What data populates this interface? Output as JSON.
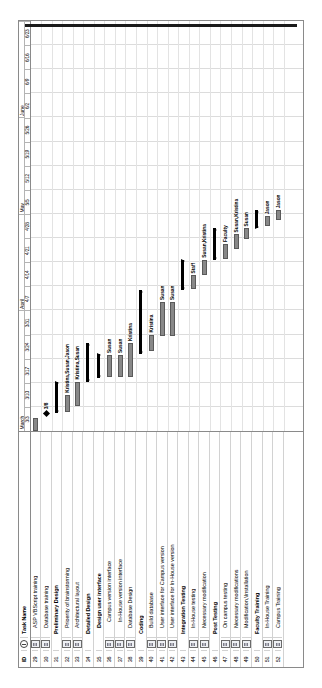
{
  "app": {
    "view": "Gantt Chart",
    "orientation": "rotated-90"
  },
  "columns": {
    "id": "ID",
    "indicator": "i",
    "task_name": "Task Name"
  },
  "timescale": {
    "months": [
      {
        "label": "March",
        "weeks": 5
      },
      {
        "label": "April",
        "weeks": 4
      },
      {
        "label": "May",
        "weeks": 4
      },
      {
        "label": "June",
        "weeks": 4
      }
    ],
    "weeks": [
      "3/3",
      "3/10",
      "3/17",
      "3/24",
      "3/31",
      "4/7",
      "4/14",
      "4/21",
      "4/28",
      "5/5",
      "5/12",
      "5/19",
      "5/26",
      "6/2",
      "6/9",
      "6/16",
      "6/23"
    ]
  },
  "colors": {
    "task_bar": "#888888",
    "task_bar_border": "#5a5a5a",
    "summary_bar": "#000000",
    "milestone": "#000000",
    "gridline": "#dcdcdc",
    "table_border": "#8a8a8a"
  },
  "chart_data": {
    "type": "bar",
    "xlabel": "",
    "ylabel": "",
    "x": [
      "3/3",
      "3/10",
      "3/17",
      "3/24",
      "3/31",
      "4/7",
      "4/14",
      "4/21",
      "4/28",
      "5/5",
      "5/12",
      "5/19",
      "5/26",
      "6/2",
      "6/9",
      "6/16",
      "6/23"
    ],
    "rows": [
      {
        "id": 29,
        "name": "ASP VBScript training",
        "indent": 1,
        "bold": false,
        "note": true,
        "kind": "task",
        "start_wk": 0.0,
        "end_wk": 0.55,
        "label": "",
        "label_side": "right"
      },
      {
        "id": 30,
        "name": "Database training",
        "indent": 1,
        "bold": false,
        "note": true,
        "kind": "milestone",
        "start_wk": 0.72,
        "end_wk": 0.72,
        "label": "3/8",
        "label_side": "right"
      },
      {
        "id": 31,
        "name": "Preliminary Design",
        "indent": 0,
        "bold": true,
        "note": false,
        "kind": "summary",
        "start_wk": 0.75,
        "end_wk": 2.05,
        "label": "",
        "label_side": "right"
      },
      {
        "id": 32,
        "name": "Prioerity of brainstorming",
        "indent": 1,
        "bold": false,
        "note": true,
        "kind": "task",
        "start_wk": 0.8,
        "end_wk": 1.5,
        "label": "Kristina,Susan,Jason",
        "label_side": "right"
      },
      {
        "id": 33,
        "name": "Architectural layout",
        "indent": 1,
        "bold": false,
        "note": true,
        "kind": "task",
        "start_wk": 1.05,
        "end_wk": 2.05,
        "label": "Kristina,Susan",
        "label_side": "right"
      },
      {
        "id": 34,
        "name": "Detailed Design",
        "indent": 0,
        "bold": true,
        "note": false,
        "kind": "summary",
        "start_wk": 2.05,
        "end_wk": 3.65,
        "label": "",
        "label_side": "right"
      },
      {
        "id": 35,
        "name": "Design user interface",
        "indent": 1,
        "bold": true,
        "note": false,
        "kind": "summary",
        "start_wk": 2.2,
        "end_wk": 3.2,
        "label": "",
        "label_side": "right"
      },
      {
        "id": 36,
        "name": "Campus version interface",
        "indent": 2,
        "bold": false,
        "note": true,
        "kind": "task",
        "start_wk": 2.25,
        "end_wk": 3.15,
        "label": "Susan",
        "label_side": "right"
      },
      {
        "id": 37,
        "name": "In-House version interface",
        "indent": 2,
        "bold": false,
        "note": true,
        "kind": "task",
        "start_wk": 2.25,
        "end_wk": 3.15,
        "label": "Susan",
        "label_side": "right"
      },
      {
        "id": 38,
        "name": "Database Design",
        "indent": 1,
        "bold": false,
        "note": true,
        "kind": "task",
        "start_wk": 2.25,
        "end_wk": 3.65,
        "label": "Kristina",
        "label_side": "right"
      },
      {
        "id": 39,
        "name": "Coding",
        "indent": 0,
        "bold": true,
        "note": false,
        "kind": "summary",
        "start_wk": 3.2,
        "end_wk": 5.85,
        "label": "",
        "label_side": "right"
      },
      {
        "id": 40,
        "name": "Build database",
        "indent": 1,
        "bold": false,
        "note": true,
        "kind": "task",
        "start_wk": 3.3,
        "end_wk": 4.0,
        "label": "Kristina",
        "label_side": "right"
      },
      {
        "id": 41,
        "name": "User interface for Campus version",
        "indent": 1,
        "bold": false,
        "note": true,
        "kind": "task",
        "start_wk": 3.95,
        "end_wk": 5.35,
        "label": "Susan",
        "label_side": "right"
      },
      {
        "id": 42,
        "name": "User interface for In-House version",
        "indent": 1,
        "bold": false,
        "note": true,
        "kind": "task",
        "start_wk": 3.95,
        "end_wk": 5.35,
        "label": "Susan",
        "label_side": "right"
      },
      {
        "id": 43,
        "name": "Integration Testing",
        "indent": 0,
        "bold": true,
        "note": false,
        "kind": "summary",
        "start_wk": 5.85,
        "end_wk": 7.1,
        "label": "",
        "label_side": "right"
      },
      {
        "id": 44,
        "name": "In-House testing",
        "indent": 1,
        "bold": false,
        "note": true,
        "kind": "task",
        "start_wk": 5.9,
        "end_wk": 6.45,
        "label": "Staff",
        "label_side": "right"
      },
      {
        "id": 45,
        "name": "Necessary modification",
        "indent": 1,
        "bold": false,
        "note": true,
        "kind": "task",
        "start_wk": 6.45,
        "end_wk": 7.1,
        "label": "Susan,Kristina",
        "label_side": "right"
      },
      {
        "id": 46,
        "name": "Post Testing",
        "indent": 0,
        "bold": true,
        "note": false,
        "kind": "summary",
        "start_wk": 7.1,
        "end_wk": 8.4,
        "label": "",
        "label_side": "right"
      },
      {
        "id": 47,
        "name": "On campus testing",
        "indent": 1,
        "bold": false,
        "note": true,
        "kind": "task",
        "start_wk": 7.15,
        "end_wk": 7.75,
        "label": "Faculty",
        "label_side": "right"
      },
      {
        "id": 48,
        "name": "Necessary modifications",
        "indent": 1,
        "bold": false,
        "note": true,
        "kind": "task",
        "start_wk": 7.55,
        "end_wk": 8.15,
        "label": "Susan,Kristina",
        "label_side": "right"
      },
      {
        "id": 49,
        "name": "Modification,\\Installation",
        "indent": 1,
        "bold": false,
        "note": true,
        "kind": "task",
        "start_wk": 7.95,
        "end_wk": 8.4,
        "label": "Susan",
        "label_side": "right"
      },
      {
        "id": 50,
        "name": "Faculty Training",
        "indent": 0,
        "bold": true,
        "note": false,
        "kind": "summary",
        "start_wk": 8.4,
        "end_wk": 9.15,
        "label": "",
        "label_side": "right"
      },
      {
        "id": 51,
        "name": "In-House Training",
        "indent": 1,
        "bold": false,
        "note": true,
        "kind": "task",
        "start_wk": 8.5,
        "end_wk": 8.9,
        "label": "Jason",
        "label_side": "right"
      },
      {
        "id": 52,
        "name": "Campus Training",
        "indent": 1,
        "bold": false,
        "note": true,
        "kind": "task",
        "start_wk": 8.75,
        "end_wk": 9.15,
        "label": "Jason",
        "label_side": "right"
      }
    ]
  }
}
